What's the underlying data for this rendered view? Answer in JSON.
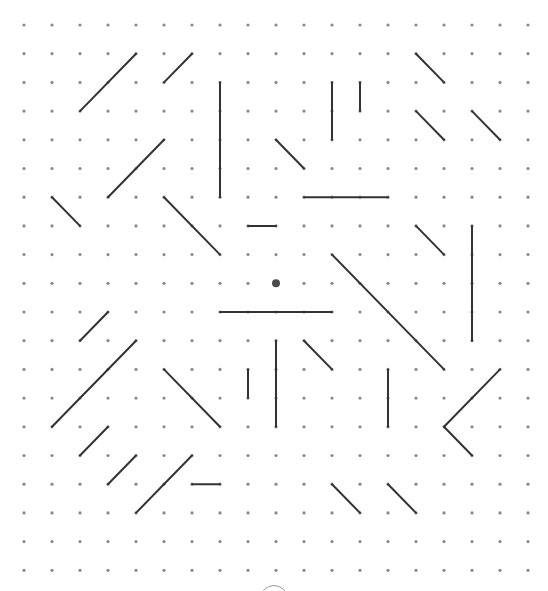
{
  "puzzle": {
    "title": "Dot grid line puzzle",
    "grid": {
      "columns": 19,
      "rows": 20,
      "origin_x": 24,
      "origin_y": 25,
      "spacing_x": 28,
      "spacing_y": 28.7,
      "dot_color": "#8a8a8a",
      "dot_radius": 1.6
    },
    "line_color": "#333333",
    "line_width": 2,
    "cursor": {
      "col": 9,
      "row": 9,
      "color": "#4a4a4a",
      "radius": 4
    },
    "lines": [
      {
        "from": [
          4,
          1
        ],
        "to": [
          2,
          3
        ]
      },
      {
        "from": [
          6,
          1
        ],
        "to": [
          5,
          2
        ]
      },
      {
        "from": [
          7,
          2
        ],
        "to": [
          7,
          6
        ]
      },
      {
        "from": [
          5,
          4
        ],
        "to": [
          3,
          6
        ]
      },
      {
        "from": [
          1,
          6
        ],
        "to": [
          2,
          7
        ]
      },
      {
        "from": [
          5,
          6
        ],
        "to": [
          7,
          8
        ]
      },
      {
        "from": [
          14,
          1
        ],
        "to": [
          15,
          2
        ]
      },
      {
        "from": [
          11,
          2
        ],
        "to": [
          11,
          4
        ]
      },
      {
        "from": [
          12,
          2
        ],
        "to": [
          12,
          3
        ]
      },
      {
        "from": [
          14,
          3
        ],
        "to": [
          15,
          4
        ]
      },
      {
        "from": [
          16,
          3
        ],
        "to": [
          17,
          4
        ]
      },
      {
        "from": [
          9,
          4
        ],
        "to": [
          10,
          5
        ]
      },
      {
        "from": [
          10,
          6
        ],
        "to": [
          13,
          6
        ]
      },
      {
        "from": [
          8,
          7
        ],
        "to": [
          9,
          7
        ]
      },
      {
        "from": [
          14,
          7
        ],
        "to": [
          15,
          8
        ]
      },
      {
        "from": [
          16,
          7
        ],
        "to": [
          16,
          11
        ]
      },
      {
        "from": [
          11,
          8
        ],
        "to": [
          15,
          12
        ]
      },
      {
        "from": [
          7,
          10
        ],
        "to": [
          11,
          10
        ]
      },
      {
        "from": [
          9,
          11
        ],
        "to": [
          9,
          14
        ]
      },
      {
        "from": [
          10,
          11
        ],
        "to": [
          11,
          12
        ]
      },
      {
        "from": [
          8,
          12
        ],
        "to": [
          8,
          13
        ]
      },
      {
        "from": [
          13,
          12
        ],
        "to": [
          13,
          14
        ]
      },
      {
        "from": [
          17,
          12
        ],
        "to": [
          15,
          14
        ]
      },
      {
        "from": [
          15,
          14
        ],
        "to": [
          16,
          15
        ]
      },
      {
        "from": [
          3,
          10
        ],
        "to": [
          2,
          11
        ]
      },
      {
        "from": [
          4,
          11
        ],
        "to": [
          1,
          14
        ]
      },
      {
        "from": [
          5,
          12
        ],
        "to": [
          7,
          14
        ]
      },
      {
        "from": [
          3,
          14
        ],
        "to": [
          2,
          15
        ]
      },
      {
        "from": [
          4,
          15
        ],
        "to": [
          3,
          16
        ]
      },
      {
        "from": [
          6,
          15
        ],
        "to": [
          4,
          17
        ]
      },
      {
        "from": [
          6,
          16
        ],
        "to": [
          7,
          16
        ]
      },
      {
        "from": [
          11,
          16
        ],
        "to": [
          12,
          17
        ]
      },
      {
        "from": [
          13,
          16
        ],
        "to": [
          14,
          17
        ]
      }
    ]
  },
  "controls": {
    "bottom_button_label": "Action button (partially visible)"
  }
}
